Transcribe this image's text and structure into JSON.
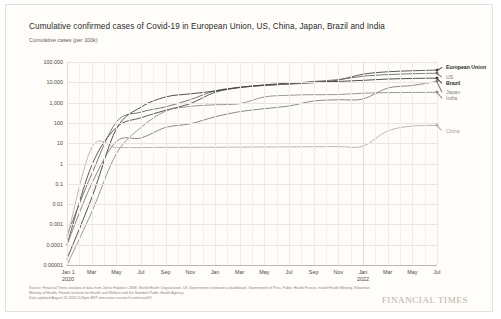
{
  "header": {
    "title": "Cumulative confirmed cases of Covid-19 in European Union, US, China, Japan, Brazil and India",
    "subtitle": "Cumulative cases (per 100k)"
  },
  "footer": {
    "source_line": "Source: Financial Times analysis of data from Johns Hopkins CSSE, World Health Organization, UK Government coronavirus dashboard, Government of Peru, Public Health France, Israeli Health Ministry, Slovenian Ministry of Health, Finnish Institute for Health and Welfare and the Swedish Public Health Agency.",
    "updated_line": "Data updated August 20 2022 4:43pm BST interactive version ft.com/covid19",
    "brand": "FINANCIAL TIMES"
  },
  "chart_data": {
    "type": "line",
    "title": "Cumulative confirmed cases of Covid-19 in European Union, US, China, Japan, Brazil and India",
    "ylabel": "Cumulative cases (per 100k)",
    "xlabel": "",
    "yscale": "log",
    "ylim": [
      1e-05,
      100000
    ],
    "grid": true,
    "legend_position": "right-inline",
    "ytick_labels": [
      "100,000",
      "10,000",
      "1,000",
      "100",
      "10",
      "1",
      "0.1",
      "0.01",
      "0.001",
      "0.0001",
      "0.00001"
    ],
    "ytick_values": [
      100000,
      10000,
      1000,
      100,
      10,
      1,
      0.1,
      0.01,
      0.001,
      0.0001,
      1e-05
    ],
    "xtick_labels": [
      "Jan 1\n2020",
      "Mar",
      "May",
      "Jul",
      "Sep",
      "Nov",
      "Jan",
      "Mar",
      "May",
      "Jul",
      "Sep",
      "Nov",
      "Jan\n2022",
      "Mar",
      "May",
      "Jul"
    ],
    "x": [
      "2020-01",
      "2020-03",
      "2020-05",
      "2020-07",
      "2020-09",
      "2020-11",
      "2021-01",
      "2021-03",
      "2021-05",
      "2021-07",
      "2021-09",
      "2021-11",
      "2022-01",
      "2022-03",
      "2022-05",
      "2022-07"
    ],
    "series": [
      {
        "name": "European Union",
        "color": "#4a4a4a",
        "label_color": "#2a2a2a",
        "label_weight": "bold",
        "end_value": 40000,
        "values": [
          0.0001,
          0.8,
          60,
          180,
          420,
          900,
          3200,
          5500,
          7000,
          8200,
          9500,
          13000,
          25000,
          33000,
          37000,
          40000
        ]
      },
      {
        "name": "US",
        "color": "#6b6b6b",
        "label_color": "#7a736c",
        "label_weight": "normal",
        "end_value": 28000,
        "values": [
          0.0003,
          0.3,
          110,
          340,
          620,
          1400,
          3800,
          5600,
          7200,
          8200,
          11000,
          13500,
          20000,
          24000,
          26500,
          28000
        ]
      },
      {
        "name": "Brazil",
        "color": "#3d3d3d",
        "label_color": "#2a2a2a",
        "label_weight": "bold",
        "end_value": 16000,
        "values": [
          2e-05,
          0.02,
          50,
          600,
          1900,
          2700,
          3700,
          5700,
          7400,
          9200,
          10300,
          11000,
          12500,
          14500,
          15500,
          16000
        ]
      },
      {
        "name": "Japan",
        "color": "#7d7d7d",
        "label_color": "#8a837c",
        "label_weight": "normal",
        "end_value": 11000,
        "values": [
          0.0001,
          0.1,
          12,
          18,
          60,
          90,
          200,
          360,
          500,
          680,
          1200,
          1380,
          1500,
          5200,
          7000,
          11000
        ]
      },
      {
        "name": "India",
        "color": "#8c8c8c",
        "label_color": "#8a837c",
        "label_weight": "normal",
        "end_value": 3200,
        "values": [
          1e-05,
          0.004,
          3,
          60,
          380,
          650,
          780,
          880,
          1900,
          2300,
          2450,
          2500,
          2900,
          3100,
          3150,
          3200
        ]
      },
      {
        "name": "China",
        "color": "#b5aea6",
        "label_color": "#a39c94",
        "label_weight": "normal",
        "end_value": 75,
        "values": [
          0.0002,
          6.0,
          6.1,
          6.1,
          6.2,
          6.2,
          6.3,
          6.4,
          6.5,
          6.6,
          6.7,
          6.8,
          7.2,
          40,
          70,
          75
        ]
      }
    ]
  }
}
